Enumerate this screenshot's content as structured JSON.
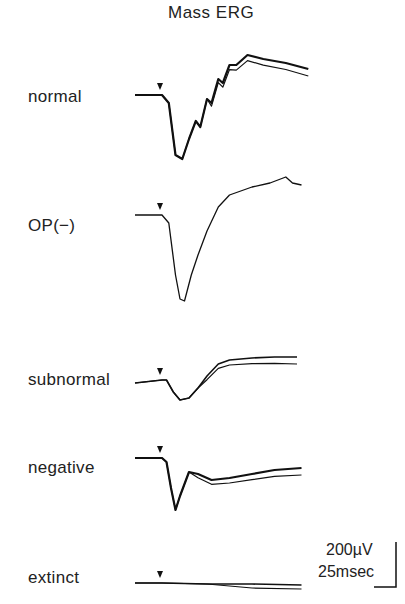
{
  "chart_data": {
    "type": "line",
    "title": "Mass ERG",
    "xlabel": "",
    "ylabel": "",
    "scale_bar": {
      "amplitude": "200µV",
      "time": "25msec"
    },
    "stimulus_marker": "arrowhead",
    "series": [
      {
        "name": "normal",
        "traces": 2,
        "points_ms_uV": [
          [
            -12,
            0
          ],
          [
            0,
            0
          ],
          [
            3,
            -40
          ],
          [
            6,
            -300
          ],
          [
            9,
            -320
          ],
          [
            12,
            -220
          ],
          [
            15,
            -130
          ],
          [
            17,
            -160
          ],
          [
            20,
            -20
          ],
          [
            22,
            -40
          ],
          [
            25,
            80
          ],
          [
            27,
            60
          ],
          [
            30,
            150
          ],
          [
            33,
            150
          ],
          [
            38,
            200
          ],
          [
            45,
            180
          ],
          [
            55,
            160
          ],
          [
            65,
            130
          ]
        ]
      },
      {
        "name": "OP(−)",
        "traces": 1,
        "points_ms_uV": [
          [
            -12,
            0
          ],
          [
            0,
            0
          ],
          [
            3,
            -40
          ],
          [
            6,
            -300
          ],
          [
            8,
            -420
          ],
          [
            10,
            -430
          ],
          [
            13,
            -300
          ],
          [
            16,
            -200
          ],
          [
            20,
            -80
          ],
          [
            25,
            40
          ],
          [
            30,
            100
          ],
          [
            40,
            140
          ],
          [
            48,
            160
          ],
          [
            55,
            190
          ],
          [
            58,
            160
          ],
          [
            62,
            150
          ]
        ]
      },
      {
        "name": "subnormal",
        "traces": 2,
        "points_ms_uV": [
          [
            -12,
            -15
          ],
          [
            0,
            0
          ],
          [
            2,
            0
          ],
          [
            5,
            -60
          ],
          [
            8,
            -100
          ],
          [
            12,
            -90
          ],
          [
            16,
            -40
          ],
          [
            20,
            20
          ],
          [
            25,
            80
          ],
          [
            30,
            100
          ],
          [
            40,
            110
          ],
          [
            50,
            115
          ],
          [
            60,
            115
          ]
        ]
      },
      {
        "name": "negative",
        "traces": 2,
        "points_ms_uV": [
          [
            -12,
            0
          ],
          [
            0,
            0
          ],
          [
            2,
            -20
          ],
          [
            4,
            -150
          ],
          [
            6,
            -260
          ],
          [
            8,
            -190
          ],
          [
            12,
            -70
          ],
          [
            16,
            -80
          ],
          [
            22,
            -110
          ],
          [
            30,
            -100
          ],
          [
            40,
            -80
          ],
          [
            50,
            -60
          ],
          [
            62,
            -50
          ]
        ]
      },
      {
        "name": "extinct",
        "traces": 2,
        "points_ms_uV": [
          [
            -12,
            0
          ],
          [
            0,
            0
          ],
          [
            20,
            -5
          ],
          [
            40,
            -5
          ],
          [
            62,
            -10
          ]
        ]
      }
    ]
  }
}
